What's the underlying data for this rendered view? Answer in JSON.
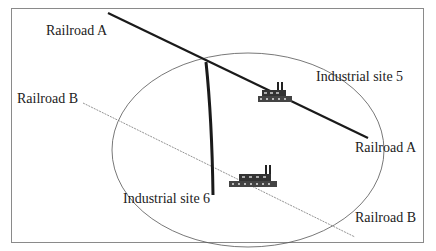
{
  "diagram": {
    "labels": {
      "railroad_a_top": "Railroad  A",
      "railroad_a_right": "Railroad  A",
      "railroad_b_left": "Railroad  B",
      "railroad_b_right": "Railroad  B",
      "site5": "Industrial site 5",
      "site6": "Industrial site 6"
    },
    "colors": {
      "railroad_a": "#1a1a1a",
      "railroad_b": "#777777",
      "circle": "#555555",
      "spur": "#1a1a1a",
      "frame": "#8a8a8a"
    }
  }
}
